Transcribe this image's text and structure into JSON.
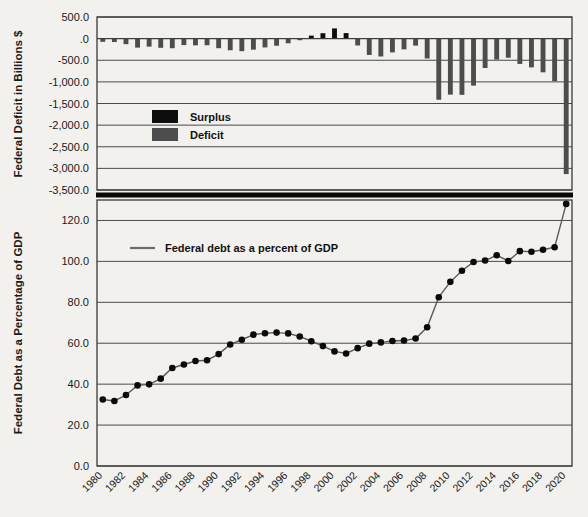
{
  "chart_data": [
    {
      "type": "bar",
      "title": "",
      "ylabel": "Federal Deficit in Billions $",
      "xlabel": "",
      "ylim": [
        -3500,
        500
      ],
      "grid": true,
      "legend_position": "inside-center",
      "legend": [
        "Surplus",
        "Deficit"
      ],
      "colors": {
        "surplus": "#0d0d0d",
        "deficit": "#4d4d4d"
      },
      "ytick_labels": [
        "500.0",
        ".0",
        "-500.0",
        "-1,000.0",
        "-1,500.0",
        "-2,000.0",
        "-2,500.0",
        "-3,000.0",
        "-3,500.0"
      ],
      "ytick_values": [
        500,
        0,
        -500,
        -1000,
        -1500,
        -2000,
        -2500,
        -3000,
        -3500
      ],
      "x": [
        1980,
        1981,
        1982,
        1983,
        1984,
        1985,
        1986,
        1987,
        1988,
        1989,
        1990,
        1991,
        1992,
        1993,
        1994,
        1995,
        1996,
        1997,
        1998,
        1999,
        2000,
        2001,
        2002,
        2003,
        2004,
        2005,
        2006,
        2007,
        2008,
        2009,
        2010,
        2011,
        2012,
        2013,
        2014,
        2015,
        2016,
        2017,
        2018,
        2019,
        2020
      ],
      "values": [
        -73.8,
        -79.0,
        -128.0,
        -207.8,
        -185.4,
        -212.3,
        -221.2,
        -149.7,
        -155.2,
        -152.6,
        -221.0,
        -269.2,
        -290.3,
        -255.1,
        -203.2,
        -164.0,
        -107.4,
        -21.9,
        69.3,
        125.6,
        236.2,
        128.2,
        -157.8,
        -377.6,
        -412.7,
        -318.3,
        -248.2,
        -160.7,
        -458.6,
        -1412.7,
        -1294.4,
        -1299.6,
        -1087.0,
        -679.5,
        -484.6,
        -442.0,
        -584.7,
        -665.4,
        -779.1,
        -984.2,
        -3131.9
      ],
      "unit": "Billions $"
    },
    {
      "type": "line",
      "title": "",
      "ylabel": "Federal Debt as a Percentage of GDP",
      "xlabel": "",
      "ylim": [
        0,
        130
      ],
      "grid": true,
      "legend_position": "inside-top-left",
      "legend": [
        "Federal debt as a percent of GDP"
      ],
      "colors": {
        "line": "#5a5a5a",
        "marker": "#0a0a0a"
      },
      "ytick_labels": [
        "0.0",
        "20.0",
        "40.0",
        "60.0",
        "80.0",
        "100.0",
        "120.0"
      ],
      "ytick_values": [
        0,
        20,
        40,
        60,
        80,
        100,
        120
      ],
      "x": [
        1980,
        1981,
        1982,
        1983,
        1984,
        1985,
        1986,
        1987,
        1988,
        1989,
        1990,
        1991,
        1992,
        1993,
        1994,
        1995,
        1996,
        1997,
        1998,
        1999,
        2000,
        2001,
        2002,
        2003,
        2004,
        2005,
        2006,
        2007,
        2008,
        2009,
        2010,
        2011,
        2012,
        2013,
        2014,
        2015,
        2016,
        2017,
        2018,
        2019,
        2020
      ],
      "values": [
        32.5,
        31.8,
        34.7,
        39.4,
        39.9,
        42.7,
        47.9,
        49.6,
        51.3,
        51.7,
        54.7,
        59.4,
        61.7,
        64.2,
        64.9,
        65.2,
        64.8,
        63.3,
        61.0,
        58.6,
        56.0,
        55.0,
        57.6,
        59.8,
        60.4,
        61.1,
        61.3,
        62.3,
        67.8,
        82.5,
        90.0,
        95.4,
        99.7,
        100.4,
        103.0,
        100.2,
        105.0,
        104.7,
        105.7,
        106.9,
        128.1
      ],
      "xtick_labels": [
        "1980",
        "1982",
        "1984",
        "1986",
        "1988",
        "1990",
        "1992",
        "1994",
        "1996",
        "1998",
        "2000",
        "2002",
        "2004",
        "2006",
        "2008",
        "2010",
        "2012",
        "2014",
        "2016",
        "2018",
        "2020"
      ],
      "xtick_values": [
        1980,
        1982,
        1984,
        1986,
        1988,
        1990,
        1992,
        1994,
        1996,
        1998,
        2000,
        2002,
        2004,
        2006,
        2008,
        2010,
        2012,
        2014,
        2016,
        2018,
        2020
      ],
      "unit": "Percent of GDP"
    }
  ],
  "top_chart": {
    "y_axis_title": "Federal Deficit in Billions $",
    "legend": {
      "surplus_label": "Surplus",
      "deficit_label": "Deficit"
    }
  },
  "bottom_chart": {
    "y_axis_title": "Federal Debt as a Percentage of GDP",
    "legend": {
      "line_label": "Federal debt as a percent of GDP"
    }
  }
}
